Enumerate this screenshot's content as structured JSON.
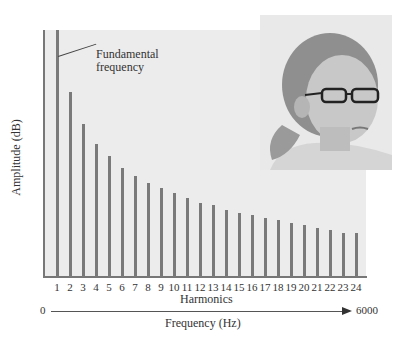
{
  "chart_data": {
    "type": "bar",
    "title": "",
    "xlabel": "Harmonics",
    "ylabel": "Amplitude (dB)",
    "categories": [
      "1",
      "2",
      "3",
      "4",
      "5",
      "6",
      "7",
      "8",
      "9",
      "10",
      "11",
      "12",
      "13",
      "14",
      "15",
      "16",
      "17",
      "18",
      "19",
      "20",
      "21",
      "22",
      "23",
      "24"
    ],
    "values": [
      100,
      75,
      62,
      54,
      49,
      44,
      41,
      38,
      36,
      34,
      32,
      30,
      29,
      27,
      26,
      25,
      24,
      23,
      22,
      21,
      20,
      19,
      18,
      18
    ],
    "ylim": [
      0,
      100
    ],
    "grid": false,
    "legend": null,
    "annotations": [
      {
        "text": "Fundamental frequency",
        "target": "1"
      }
    ],
    "secondary_axis": {
      "label": "Frequency (Hz)",
      "start": "0",
      "end": "6000"
    }
  },
  "labels": {
    "ylabel": "Amplitude (dB)",
    "xlabel": "Harmonics",
    "annotation_line1": "Fundamental",
    "annotation_line2": "frequency",
    "freq_start": "0",
    "freq_end": "6000",
    "freq_label": "Frequency (Hz)"
  },
  "photo": {
    "description": "Photo of a woman with glasses and pulled-back hair"
  }
}
